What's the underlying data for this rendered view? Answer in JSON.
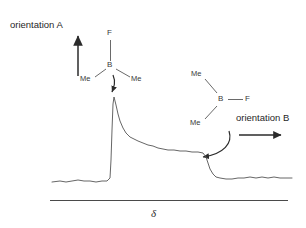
{
  "figure": {
    "background_color": "#ffffff",
    "stroke_color": "#3a3a3a",
    "axis_color": "#4a4a4a",
    "trace_color": "#555555"
  },
  "annotations": {
    "orientation_a_label": "orientation A",
    "orientation_b_label": "orientation B"
  },
  "molecule_a": {
    "top_atom": "F",
    "center_atom": "B",
    "left_substituent": "Me",
    "right_substituent": "Me"
  },
  "molecule_b": {
    "upper_left_substituent": "Me",
    "center_atom": "B",
    "right_atom": "F",
    "lower_left_substituent": "Me"
  },
  "axis": {
    "label": "δ"
  },
  "chart_data": {
    "type": "line",
    "title": "",
    "xlabel": "δ",
    "ylabel": "",
    "grid": false,
    "legend": null,
    "series": [
      {
        "name": "spectrum",
        "points": [
          [
            52,
            182
          ],
          [
            60,
            181
          ],
          [
            66,
            182
          ],
          [
            72,
            181
          ],
          [
            78,
            180
          ],
          [
            84,
            181
          ],
          [
            90,
            181
          ],
          [
            96,
            182
          ],
          [
            102,
            181
          ],
          [
            107,
            181
          ],
          [
            110,
            178
          ],
          [
            111,
            160
          ],
          [
            112,
            130
          ],
          [
            113,
            104
          ],
          [
            114,
            97
          ],
          [
            116,
            105
          ],
          [
            118,
            114
          ],
          [
            120,
            121
          ],
          [
            123,
            128
          ],
          [
            126,
            133
          ],
          [
            130,
            137
          ],
          [
            134,
            139
          ],
          [
            138,
            141
          ],
          [
            143,
            143
          ],
          [
            148,
            145
          ],
          [
            153,
            146
          ],
          [
            158,
            148
          ],
          [
            163,
            149
          ],
          [
            168,
            150
          ],
          [
            174,
            150
          ],
          [
            180,
            151
          ],
          [
            186,
            151
          ],
          [
            192,
            152
          ],
          [
            198,
            152
          ],
          [
            203,
            153
          ],
          [
            206,
            157
          ],
          [
            208,
            163
          ],
          [
            210,
            169
          ],
          [
            213,
            174
          ],
          [
            216,
            177
          ],
          [
            220,
            178
          ],
          [
            226,
            179
          ],
          [
            232,
            179
          ],
          [
            238,
            178
          ],
          [
            244,
            178
          ],
          [
            250,
            177
          ],
          [
            256,
            178
          ],
          [
            262,
            177
          ],
          [
            268,
            178
          ],
          [
            274,
            177
          ],
          [
            280,
            178
          ],
          [
            286,
            178
          ],
          [
            292,
            178
          ]
        ]
      }
    ]
  }
}
